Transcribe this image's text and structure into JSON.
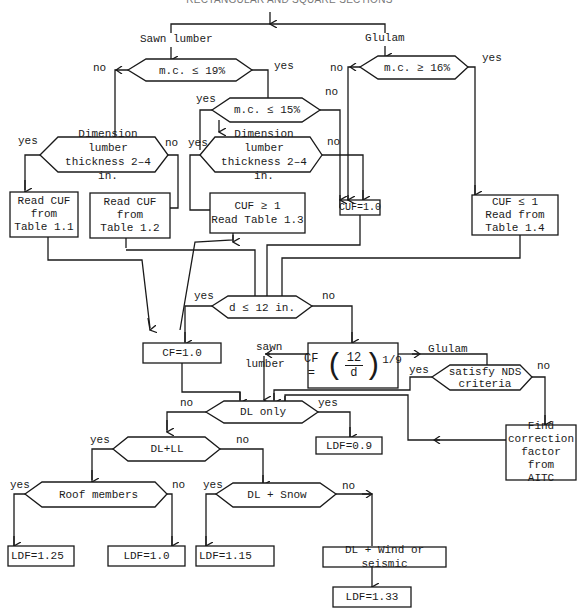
{
  "title": "RECTANGULAR AND SQUARE SECTIONS",
  "branches": {
    "sawn_lumber": "Sawn lumber",
    "glulam": "Glulam"
  },
  "decisions": {
    "mc19": "m.c. ≤  19%",
    "mc15": "m.c. ≤  15%",
    "mc16": "m.c. ≥  16%",
    "dim_left_line1": "Dimension lumber",
    "dim_left_line2": "thickness 2–4 in.",
    "dim_mid_line1": "Dimension lumber",
    "dim_mid_line2": "thickness 2–4 in.",
    "depth": "d ≤ 12 in.",
    "nds_line1": "satisfy NDS",
    "nds_line2": "criteria",
    "dl_only": "DL only",
    "dl_ll": "DL+LL",
    "roof": "Roof members",
    "dl_snow": "DL + Snow"
  },
  "processes": {
    "cuf_t11_line1": "Read CUF",
    "cuf_t11_line2": "from",
    "cuf_t11_line3": "Table 1.1",
    "cuf_t12_line1": "Read CUF",
    "cuf_t12_line2": "from",
    "cuf_t12_line3": "Table 1.2",
    "cuf_t13_line1": "CUF ≥ 1",
    "cuf_t13_line2": "Read Table 1.3",
    "cuf_1": "CUF=1.0",
    "cuf_t14_line1": "CUF ≤ 1",
    "cuf_t14_line2": "Read from",
    "cuf_t14_line3": "Table 1.4",
    "cf_1": "CF=1.0",
    "cf_formula_lhs": "CF  =",
    "cf_formula_num": "12",
    "cf_formula_den": "d",
    "cf_formula_exp": "1/9",
    "aitc_line1": "Find correction",
    "aitc_line2": "factor from",
    "aitc_line3": "AITC",
    "dl_wind": "DL + Wind or seismic"
  },
  "results": {
    "ldf_09": "LDF=0.9",
    "ldf_125": "LDF=1.25",
    "ldf_10": "LDF=1.0",
    "ldf_115": "LDF=1.15",
    "ldf_133": "LDF=1.33"
  },
  "edge_labels": {
    "yes": "yes",
    "no": "no",
    "sawn": "sawn",
    "lumber": "lumber",
    "glulam": "Glulam"
  }
}
